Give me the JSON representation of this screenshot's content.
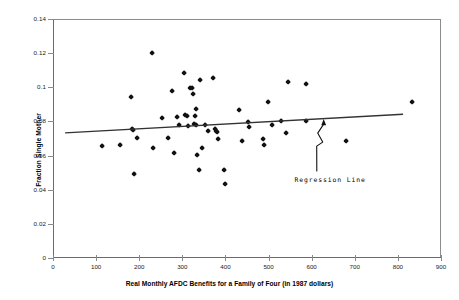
{
  "chart": {
    "type": "scatter",
    "title": "",
    "xlabel": "Real Monthly AFDC Benefits for a Family of Four (in 1987 dollars)",
    "ylabel": "Fraction Single Mother",
    "annotation": "Regression Line"
  },
  "chart_data": {
    "type": "scatter",
    "title": "",
    "xlabel": "Real Monthly AFDC Benefits for a Family of Four (in 1987 dollars)",
    "ylabel": "Fraction Single Mother",
    "xlim": [
      0,
      900
    ],
    "ylim": [
      0,
      0.14
    ],
    "xticks": [
      0,
      100,
      200,
      300,
      400,
      500,
      600,
      700,
      800,
      900
    ],
    "yticks": [
      0,
      0.02,
      0.04,
      0.06,
      0.08,
      0.1,
      0.12,
      0.14
    ],
    "xtick_labels": [
      "0",
      "100",
      "200",
      "300",
      "400",
      "500",
      "600",
      "700",
      "800",
      "900"
    ],
    "ytick_labels": [
      "0",
      "0.02",
      "0.04",
      "0.06",
      "0.08",
      "0.1",
      "0.12",
      "0.14"
    ],
    "grid": false,
    "legend": null,
    "marker_color": "#111111",
    "line_color": "#333333",
    "annotations": [
      {
        "text": "Regression Line",
        "x": 560,
        "y": 0.0455,
        "arrow_to_x": 628,
        "arrow_to_y": 0.0808
      }
    ],
    "series": [
      {
        "name": "States",
        "points": [
          [
            114,
            0.0655
          ],
          [
            155,
            0.066
          ],
          [
            180,
            0.094
          ],
          [
            183,
            0.0757
          ],
          [
            186,
            0.0751
          ],
          [
            189,
            0.0494
          ],
          [
            194,
            0.0703
          ],
          [
            230,
            0.1201
          ],
          [
            233,
            0.0646
          ],
          [
            253,
            0.0821
          ],
          [
            268,
            0.0703
          ],
          [
            277,
            0.0977
          ],
          [
            281,
            0.0613
          ],
          [
            288,
            0.0826
          ],
          [
            293,
            0.0777
          ],
          [
            305,
            0.1085
          ],
          [
            306,
            0.084
          ],
          [
            310,
            0.0831
          ],
          [
            314,
            0.0771
          ],
          [
            318,
            0.0995
          ],
          [
            322,
            0.0993
          ],
          [
            326,
            0.0963
          ],
          [
            328,
            0.0787
          ],
          [
            330,
            0.0832
          ],
          [
            331,
            0.087
          ],
          [
            333,
            0.078
          ],
          [
            335,
            0.06
          ],
          [
            338,
            0.0515
          ],
          [
            341,
            0.1043
          ],
          [
            345,
            0.0645
          ],
          [
            352,
            0.0776
          ],
          [
            360,
            0.0746
          ],
          [
            372,
            0.1053
          ],
          [
            375,
            0.0755
          ],
          [
            378,
            0.0742
          ],
          [
            380,
            0.0738
          ],
          [
            383,
            0.0694
          ],
          [
            396,
            0.0515
          ],
          [
            399,
            0.0433
          ],
          [
            432,
            0.0869
          ],
          [
            438,
            0.0686
          ],
          [
            452,
            0.0797
          ],
          [
            455,
            0.0769
          ],
          [
            487,
            0.0694
          ],
          [
            490,
            0.0661
          ],
          [
            498,
            0.0911
          ],
          [
            508,
            0.078
          ],
          [
            530,
            0.0803
          ],
          [
            540,
            0.0733
          ],
          [
            545,
            0.1033
          ],
          [
            586,
            0.0802
          ],
          [
            588,
            0.1021
          ],
          [
            680,
            0.0686
          ],
          [
            833,
            0.0914
          ]
        ]
      }
    ],
    "regression_line": {
      "label": "Regression Line",
      "x_start": 28,
      "y_start": 0.0733,
      "x_end": 812,
      "y_end": 0.0842
    }
  }
}
